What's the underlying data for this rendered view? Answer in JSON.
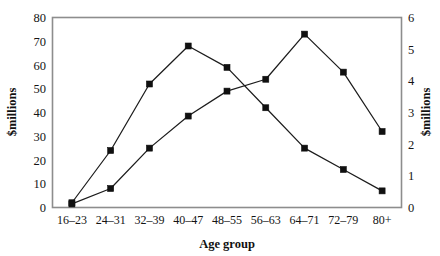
{
  "chart_data": {
    "type": "line",
    "title": "",
    "subtitle": "",
    "xlabel": "Age group",
    "ylabel": "$millions",
    "y2label": "$millions",
    "categories": [
      "16–23",
      "24–31",
      "32–39",
      "40–47",
      "48–55",
      "56–63",
      "64–71",
      "72–79",
      "80+"
    ],
    "ylim": [
      0,
      80
    ],
    "yticks": [
      0,
      10,
      20,
      30,
      40,
      50,
      60,
      70,
      80
    ],
    "ytick_labels": [
      "0",
      "10",
      "20",
      "30",
      "40",
      "50",
      "60",
      "70",
      "80"
    ],
    "y2lim": [
      0,
      6
    ],
    "y2ticks": [
      0,
      1,
      2,
      3,
      4,
      5,
      6
    ],
    "y2tick_labels": [
      "0",
      "1",
      "2",
      "3",
      "4",
      "5",
      "6"
    ],
    "grid": false,
    "legend": "none",
    "marker": "square",
    "series": [
      {
        "name": "series-1",
        "axis": "left",
        "values": [
          2,
          24,
          52,
          68,
          59,
          42,
          25,
          16,
          7
        ]
      },
      {
        "name": "series-2",
        "axis": "left",
        "values": [
          1.5,
          8,
          25,
          38.5,
          49,
          54,
          73,
          57,
          32
        ]
      }
    ],
    "colors": {
      "line": "#1c1c1c",
      "marker": "#101010",
      "frame": "#8d8d8d",
      "background": "#ffffff"
    }
  },
  "axes": {
    "left_title": "$millions",
    "right_title": "$millions",
    "bottom_title": "Age group"
  }
}
